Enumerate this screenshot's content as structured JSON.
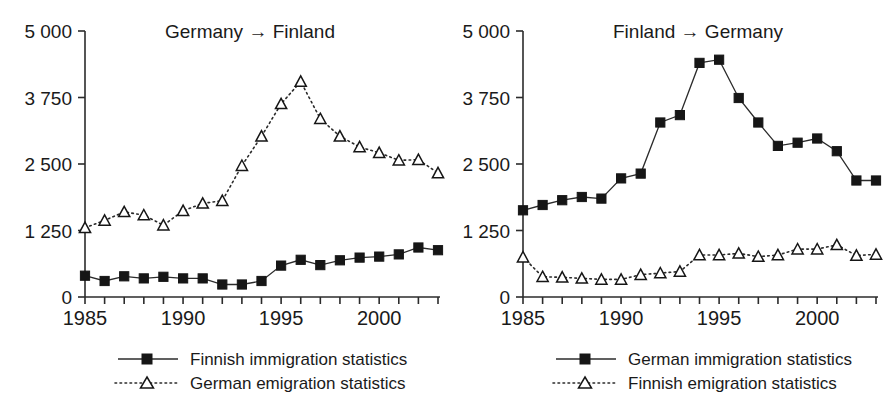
{
  "figure": {
    "width": 896,
    "height": 412,
    "background": "#ffffff",
    "ink_color": "#1a1a1a"
  },
  "chart_data": [
    {
      "type": "line",
      "panel": "left",
      "title": "Germany → Finland",
      "xlabel": "",
      "ylabel": "",
      "xlim": [
        1985,
        2003
      ],
      "ylim": [
        0,
        5000
      ],
      "grid": false,
      "legend_position": "below",
      "x": [
        1985,
        1986,
        1987,
        1988,
        1989,
        1990,
        1991,
        1992,
        1993,
        1994,
        1995,
        1996,
        1997,
        1998,
        1999,
        2000,
        2001,
        2002,
        2003
      ],
      "xtick_labels": [
        "1985",
        "1990",
        "1995",
        "2000"
      ],
      "xtick_values": [
        1985,
        1990,
        1995,
        2000
      ],
      "ytick_labels": [
        "0",
        "1 250",
        "2 500",
        "3 750",
        "5 000"
      ],
      "ytick_values": [
        0,
        1250,
        2500,
        3750,
        5000
      ],
      "series": [
        {
          "name": "Finnish immigration statistics",
          "marker": "square-filled",
          "linestyle": "solid",
          "values": [
            400,
            300,
            390,
            350,
            380,
            350,
            350,
            235,
            235,
            300,
            590,
            700,
            600,
            690,
            740,
            760,
            800,
            930,
            880
          ]
        },
        {
          "name": "German emigration statistics",
          "marker": "triangle-open",
          "linestyle": "dotted",
          "values": [
            1300,
            1440,
            1600,
            1540,
            1350,
            1620,
            1760,
            1810,
            2470,
            3020,
            3630,
            4050,
            3350,
            3020,
            2820,
            2710,
            2570,
            2580,
            2330
          ]
        }
      ]
    },
    {
      "type": "line",
      "panel": "right",
      "title": "Finland → Germany",
      "xlabel": "",
      "ylabel": "",
      "xlim": [
        1985,
        2003
      ],
      "ylim": [
        0,
        5000
      ],
      "grid": false,
      "legend_position": "below",
      "x": [
        1985,
        1986,
        1987,
        1988,
        1989,
        1990,
        1991,
        1992,
        1993,
        1994,
        1995,
        1996,
        1997,
        1998,
        1999,
        2000,
        2001,
        2002,
        2003
      ],
      "xtick_labels": [
        "1985",
        "1990",
        "1995",
        "2000"
      ],
      "xtick_values": [
        1985,
        1990,
        1995,
        2000
      ],
      "ytick_labels": [
        "0",
        "1 250",
        "2 500",
        "3 750",
        "5 000"
      ],
      "ytick_values": [
        0,
        1250,
        2500,
        3750,
        5000
      ],
      "series": [
        {
          "name": "German immigration statistics",
          "marker": "square-filled",
          "linestyle": "solid",
          "values": [
            1630,
            1730,
            1820,
            1880,
            1850,
            2230,
            2320,
            3280,
            3420,
            4400,
            4460,
            3740,
            3280,
            2840,
            2900,
            2980,
            2740,
            2190,
            2190
          ]
        },
        {
          "name": "Finnish emigration statistics",
          "marker": "triangle-open",
          "linestyle": "dotted",
          "values": [
            750,
            380,
            370,
            350,
            330,
            330,
            420,
            450,
            480,
            790,
            790,
            820,
            760,
            790,
            900,
            900,
            980,
            780,
            800
          ]
        }
      ]
    }
  ]
}
